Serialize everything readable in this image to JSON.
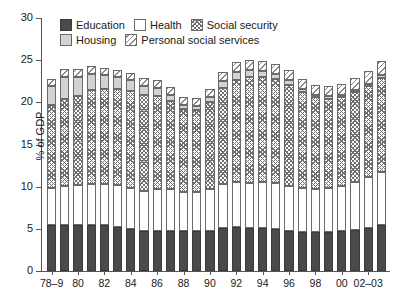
{
  "chart_data": {
    "type": "bar",
    "stacked": true,
    "title": "",
    "xlabel": "",
    "ylabel": "% of GDP",
    "ylim": [
      0,
      30
    ],
    "ytick_values": [
      0,
      5,
      10,
      15,
      20,
      25,
      30
    ],
    "ytick_labels": [
      "0",
      "5",
      "10",
      "15",
      "20",
      "25",
      "30"
    ],
    "grid": false,
    "legend_position": "top-inside",
    "categories": [
      "78-9",
      "79-80",
      "80",
      "81",
      "82",
      "83",
      "84",
      "85",
      "86",
      "87",
      "88",
      "89",
      "90",
      "91",
      "92",
      "93",
      "94",
      "95",
      "96",
      "97",
      "98",
      "99",
      "00",
      "01",
      "02-03",
      "03-04"
    ],
    "xtick_labels": [
      {
        "index": 0,
        "label": "78–9"
      },
      {
        "index": 2,
        "label": "80"
      },
      {
        "index": 4,
        "label": "82"
      },
      {
        "index": 6,
        "label": "84"
      },
      {
        "index": 8,
        "label": "86"
      },
      {
        "index": 10,
        "label": "88"
      },
      {
        "index": 12,
        "label": "90"
      },
      {
        "index": 14,
        "label": "92"
      },
      {
        "index": 16,
        "label": "94"
      },
      {
        "index": 18,
        "label": "96"
      },
      {
        "index": 20,
        "label": "98"
      },
      {
        "index": 22,
        "label": "00"
      },
      {
        "index": 24,
        "label": "02–03"
      }
    ],
    "series": [
      {
        "name": "Education",
        "key": "education",
        "fill": "solid-dark",
        "color": "#4a4a4a",
        "values": [
          5.5,
          5.5,
          5.5,
          5.5,
          5.5,
          5.2,
          5.0,
          4.7,
          4.8,
          4.8,
          4.7,
          4.7,
          4.8,
          5.1,
          5.2,
          5.1,
          5.1,
          5.0,
          4.8,
          4.6,
          4.6,
          4.6,
          4.7,
          4.9,
          5.1,
          5.4
        ]
      },
      {
        "name": "Health",
        "key": "health",
        "fill": "white",
        "color": "#ffffff",
        "values": [
          4.4,
          4.6,
          4.7,
          4.8,
          4.8,
          5.0,
          4.9,
          4.8,
          4.9,
          4.9,
          4.7,
          4.7,
          4.9,
          5.2,
          5.3,
          5.3,
          5.4,
          5.4,
          5.3,
          5.2,
          5.1,
          5.2,
          5.4,
          5.7,
          6.0,
          6.3
        ]
      },
      {
        "name": "Social security",
        "key": "social_security",
        "fill": "crosshatch",
        "color": "#707070",
        "values": [
          9.8,
          10.3,
          10.6,
          11.2,
          11.3,
          11.4,
          11.4,
          11.4,
          11.1,
          10.5,
          9.8,
          9.7,
          10.3,
          11.4,
          12.2,
          12.6,
          12.5,
          12.4,
          12.0,
          11.4,
          10.9,
          10.6,
          10.5,
          10.6,
          10.8,
          11.2
        ]
      },
      {
        "name": "Housing",
        "key": "housing",
        "fill": "light-gray",
        "color": "#d3d3d3",
        "values": [
          2.2,
          2.6,
          2.2,
          1.9,
          1.6,
          1.4,
          1.3,
          1.1,
          0.9,
          0.7,
          0.5,
          0.5,
          0.6,
          0.8,
          0.9,
          0.8,
          0.7,
          0.6,
          0.5,
          0.4,
          0.3,
          0.3,
          0.3,
          0.3,
          0.3,
          0.4
        ]
      },
      {
        "name": "Personal social services",
        "key": "personal_social_services",
        "fill": "diagonal-hatch",
        "color": "#8a8a8a",
        "values": [
          0.9,
          0.9,
          0.9,
          0.9,
          0.9,
          0.9,
          0.9,
          0.9,
          0.9,
          0.9,
          0.9,
          0.9,
          1.0,
          1.1,
          1.2,
          1.2,
          1.2,
          1.2,
          1.2,
          1.2,
          1.2,
          1.2,
          1.3,
          1.4,
          1.5,
          1.6
        ]
      }
    ],
    "totals": [
      22.8,
      23.9,
      23.9,
      24.3,
      24.1,
      23.9,
      23.5,
      22.9,
      22.6,
      21.8,
      20.6,
      20.5,
      21.6,
      23.6,
      24.8,
      25.0,
      24.9,
      24.6,
      23.8,
      22.8,
      22.1,
      21.9,
      22.2,
      22.9,
      23.7,
      24.9
    ]
  },
  "legend": {
    "rows": [
      [
        {
          "label": "Education",
          "fill_class": "f-education",
          "swatch_name": "legend-swatch-education"
        },
        {
          "label": "Health",
          "fill_class": "f-health",
          "swatch_name": "legend-swatch-health"
        },
        {
          "label": "Social security",
          "fill_class": "f-socsec",
          "swatch_name": "legend-swatch-social-security"
        }
      ],
      [
        {
          "label": "Housing",
          "fill_class": "f-housing",
          "swatch_name": "legend-swatch-housing"
        },
        {
          "label": "Personal social services",
          "fill_class": "f-pss",
          "swatch_name": "legend-swatch-personal-social-services"
        }
      ]
    ]
  }
}
